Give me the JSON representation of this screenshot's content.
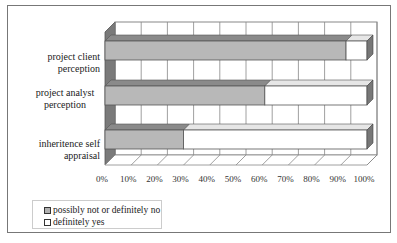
{
  "chart_data": {
    "type": "bar",
    "orientation": "horizontal",
    "stacked": "100%",
    "style": "3d",
    "title": "",
    "xlabel": "",
    "ylabel": "",
    "categories": [
      "project client perception",
      "project analyst perception",
      "inheritence self appraisal"
    ],
    "series": [
      {
        "name": "possibly not or definitely no",
        "color": "#b8b8b8",
        "values": [
          92,
          61,
          30
        ]
      },
      {
        "name": "definitely yes",
        "color": "#ffffff",
        "values": [
          8,
          39,
          70
        ]
      }
    ],
    "xlim": [
      0,
      100
    ],
    "x_ticks": [
      "0%",
      "10%",
      "20%",
      "30%",
      "40%",
      "50%",
      "60%",
      "70%",
      "80%",
      "90%",
      "100%"
    ],
    "grid": true,
    "legend_position": "bottom-left"
  },
  "labels": {
    "cat0": "project client perception",
    "cat1_line1": "project analyst",
    "cat1_line2": "perception",
    "cat2": "inheritence self appraisal"
  },
  "legend": {
    "item0": "possibly not or definitely no",
    "item1": "definitely yes"
  }
}
